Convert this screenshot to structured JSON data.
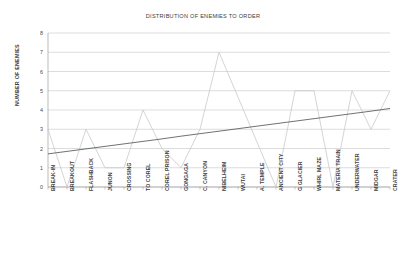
{
  "chart_data": {
    "type": "line",
    "title": "DISTRIBUTION OF ENEMIES TO ORDER",
    "xlabel": "",
    "ylabel": "NUMBER OF ENEMIES",
    "ylim": [
      0,
      8
    ],
    "yticks": [
      0,
      1,
      2,
      3,
      4,
      5,
      6,
      7,
      8
    ],
    "grid": true,
    "legend": "none",
    "categories": [
      "BREAK-IN",
      "BREAKOUT",
      "FLASHBACK",
      "JUNON",
      "CROSSING",
      "TO COREL",
      "COREL PRISON",
      "GONGAGA",
      "C. CANYON",
      "NIBELHEIM",
      "WUTAI",
      "A. TEMPLE",
      "ANCIENT CITY",
      "G GLACIER",
      "WHIRL MAZE",
      "MATERIA TRAIN",
      "UNDERWATER",
      "MIDGAR",
      "CRATER"
    ],
    "series": [
      {
        "name": "NUMBER OF ENEMIES",
        "color": "#c9c9c9",
        "values": [
          3,
          0,
          3,
          1,
          1,
          4,
          2,
          1,
          3,
          7,
          4.67,
          2.33,
          0,
          5,
          5,
          0,
          5,
          3,
          5
        ]
      },
      {
        "name": "LINEAR TREND",
        "color": "#4d4d4d",
        "values": [
          1.72,
          1.85,
          1.98,
          2.11,
          2.24,
          2.37,
          2.5,
          2.64,
          2.77,
          2.9,
          3.03,
          3.16,
          3.29,
          3.42,
          3.55,
          3.68,
          3.81,
          3.94,
          4.08
        ]
      }
    ]
  },
  "colors": {
    "grid": "#b8b8b8",
    "axis": "#8f8f8f",
    "data_line": "#c9c9c9",
    "trend_line": "#4d4d4d",
    "text": "#3f3f3f",
    "background": "#ffffff"
  }
}
